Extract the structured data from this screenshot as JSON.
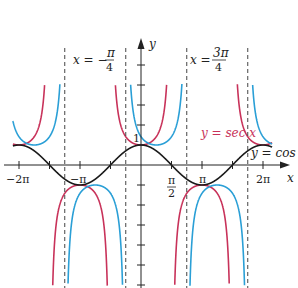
{
  "chart_data": {
    "type": "line",
    "title": "",
    "xlabel": "x",
    "ylabel": "y",
    "xlim": [
      -6.6,
      7.0
    ],
    "ylim": [
      -4.5,
      6.0
    ],
    "grid": false,
    "x_ticks": [
      "-2π",
      "-π",
      "π/2",
      "π",
      "2π"
    ],
    "y_tick_label": "1",
    "series": [
      {
        "name": "y = cos x",
        "color": "#1a1a1a",
        "function": "cos(x)"
      },
      {
        "name": "y = sec x",
        "color": "#c8325a",
        "function": "sec(x)"
      },
      {
        "name": "shifted secant",
        "color": "#2a9fd6",
        "function": "sec(x - π/4)"
      }
    ],
    "asymptotes": [
      {
        "x_label": "x = -π/4",
        "style": "dashed"
      },
      {
        "x_label": "x = 3π/4",
        "style": "dashed"
      }
    ],
    "annotations": [
      "x = -π/4",
      "x = 3π/4",
      "y = sec x",
      "y = cos x"
    ]
  },
  "labels": {
    "x_axis": "x",
    "y_axis": "y",
    "tick_neg2pi": "−2π",
    "tick_negpi": "−π",
    "tick_pi": "π",
    "tick_2pi": "2π",
    "tick_pihalf_num": "π",
    "tick_pihalf_den": "2",
    "tick_one": "1",
    "asym_left_lhs": "x = −",
    "asym_left_num": "π",
    "asym_left_den": "4",
    "asym_right_lhs": "x =",
    "asym_right_num": "3π",
    "asym_right_den": "4",
    "sec_label": "y = sec x",
    "cos_label": "y = cos x"
  },
  "colors": {
    "cos": "#1a1a1a",
    "sec": "#c8325a",
    "shifted": "#2a9fd6",
    "axis": "#222222",
    "dashed": "#444444"
  }
}
